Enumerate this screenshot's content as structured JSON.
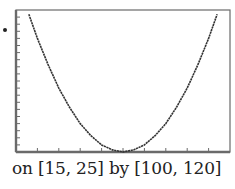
{
  "caption": "on [15, 25] by [100, 120]",
  "colors": {
    "frame": "#6a6a6a",
    "curve": "#333333",
    "text": "#222222"
  },
  "chart_data": {
    "type": "line",
    "title": "",
    "xlabel": "",
    "ylabel": "",
    "xlim": [
      15,
      25
    ],
    "ylim": [
      100,
      120
    ],
    "x_tick_step": 1,
    "y_tick_step": 1,
    "grid": false,
    "legend": null,
    "window_label": "on [15, 25] by [100, 120]",
    "series": [
      {
        "name": "y ≈ (x − 20)² + 100",
        "x": [
          15.6,
          16,
          16.5,
          17,
          17.5,
          18,
          18.5,
          19,
          19.5,
          20,
          20.5,
          21,
          21.5,
          22,
          22.5,
          23,
          23.5,
          24,
          24.4
        ],
        "values": [
          119.4,
          116.0,
          112.3,
          109.0,
          106.3,
          104.0,
          102.3,
          101.0,
          100.3,
          100.0,
          100.3,
          101.0,
          102.3,
          104.0,
          106.3,
          109.0,
          112.3,
          116.0,
          119.4
        ]
      }
    ]
  }
}
